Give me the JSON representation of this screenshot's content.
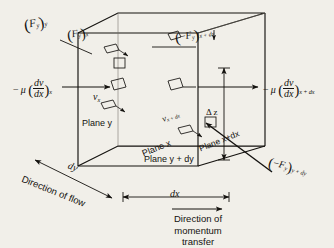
{
  "figure": {
    "background_color": "#f1efe9",
    "ink_color": "#14120f"
  },
  "labels": {
    "force_y_at_y": {
      "base": "F",
      "base_sub": "y",
      "outer_sub": "y",
      "sign": "",
      "text": "(F_y)_y"
    },
    "force_y_at_x": {
      "base": "F",
      "base_sub": "y",
      "outer_sub": "x",
      "sign": "",
      "text": "(F_y)_x"
    },
    "force_y_at_x_plus_dx": {
      "base": "F",
      "base_sub": "y",
      "outer_sub": "x + dx",
      "sign": "-",
      "text": "(-F_y)_x+dx"
    },
    "force_y_at_y_plus_dy": {
      "base": "F",
      "base_sub": "y",
      "outer_sub": "y + dy",
      "sign": "-",
      "text": "(-F_y)_y+dy"
    },
    "shear_left": {
      "mu": "− μ",
      "num": "dv",
      "den": "dx",
      "sub": "x",
      "text": "-mu(dv/dx)_x"
    },
    "shear_right": {
      "mu": "− μ",
      "num": "dv",
      "den": "dx",
      "sub": "x + dx",
      "text": "-mu(dv/dx)_x+dx"
    },
    "velocity_x": {
      "base": "v",
      "sub": "x",
      "text": "v_x"
    },
    "velocity_x_plus_dx": {
      "base": "v",
      "sub": "x + dx",
      "text": "v_x+dx"
    },
    "plane_y": "Plane y",
    "plane_x": "Plane x",
    "plane_y_plus_dy": "Plane y + dy",
    "plane_x_plus_dx": "Plane x+dx",
    "delta_z": "Δ z",
    "dim_dy": "dy",
    "dim_dx": "dx",
    "direction_of_flow": "Direction of flow",
    "direction_of_momentum_transfer_line1": "Direction of",
    "direction_of_momentum_transfer_line2": "momentum",
    "direction_of_momentum_transfer_line3": "transfer"
  }
}
